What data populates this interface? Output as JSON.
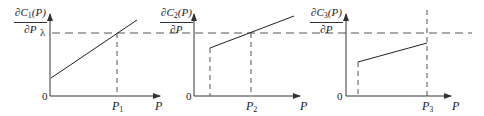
{
  "figure": {
    "lambda_label": "λ",
    "origin_label": "0",
    "x_axis_label": "P",
    "panels": [
      {
        "id": 1,
        "ylabel_num_prefix": "∂C",
        "ylabel_sub": "1",
        "ylabel_num_suffix": "(P)",
        "ylabel_den": "∂P",
        "p_label": "P",
        "p_sub": "1",
        "description": "Marginal cost line starting at positive intercept, rising linearly, crossing λ at P1"
      },
      {
        "id": 2,
        "ylabel_num_prefix": "∂C",
        "ylabel_sub": "2",
        "ylabel_num_suffix": "(P)",
        "ylabel_den": "∂P",
        "p_label": "P",
        "p_sub": "2",
        "description": "Marginal cost line starting at minimum output (dashed drop), rising linearly, crossing λ at P2"
      },
      {
        "id": 3,
        "ylabel_num_prefix": "∂C",
        "ylabel_sub": "3",
        "ylabel_num_suffix": "(P)",
        "ylabel_den": "∂P",
        "p_label": "P",
        "p_sub": "3",
        "description": "Marginal cost line from minimum output rising but staying below λ up to maximum output P3"
      }
    ]
  }
}
